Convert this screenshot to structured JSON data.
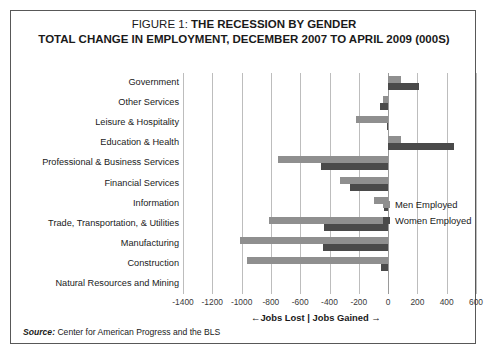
{
  "figure": {
    "title_prefix": "FIGURE 1:",
    "title_main": "THE RECESSION BY GENDER",
    "subtitle": "TOTAL CHANGE IN EMPLOYMENT, DECEMBER 2007 TO APRIL 2009 (000S)",
    "source_label": "Source:",
    "source_text": "Center for American Progress and the BLS",
    "axis_caption": "←Jobs Lost | Jobs Gained →"
  },
  "legend": {
    "position": "inside-right",
    "entries": [
      {
        "name": "Men Employed",
        "color": "#8f8f8f"
      },
      {
        "name": "Women Employed",
        "color": "#4a4a4a"
      }
    ]
  },
  "chart_data": {
    "type": "bar",
    "orientation": "horizontal",
    "title": "FIGURE 1: THE RECESSION BY GENDER",
    "subtitle": "TOTAL CHANGE IN EMPLOYMENT, DECEMBER 2007 TO APRIL 2009 (000S)",
    "xlabel": "←Jobs Lost | Jobs Gained →",
    "ylabel": "",
    "xlim": [
      -1400,
      600
    ],
    "xticks": [
      -1400,
      -1200,
      -1000,
      -800,
      -600,
      -400,
      -200,
      0,
      200,
      400,
      600
    ],
    "xtick_labels": [
      "-1400",
      "-1200",
      "-1000",
      "-800",
      "-600",
      "-400",
      "-200",
      "0",
      "200",
      "400",
      "600"
    ],
    "grid": true,
    "grid_axis": "x",
    "categories": [
      "Government",
      "Other Services",
      "Leisure & Hospitality",
      "Education & Health",
      "Professional & Business Services",
      "Financial Services",
      "Information",
      "Trade, Transportation, & Utilities",
      "Manufacturing",
      "Construction",
      "Natural Resources and Mining"
    ],
    "series": [
      {
        "name": "Men Employed",
        "color": "#8f8f8f",
        "values": [
          90,
          -35,
          -220,
          90,
          -750,
          -330,
          -95,
          -810,
          -1010,
          -960,
          0
        ]
      },
      {
        "name": "Women Employed",
        "color": "#4a4a4a",
        "values": [
          210,
          -55,
          -10,
          450,
          -455,
          -260,
          -30,
          -435,
          -445,
          -50,
          0
        ]
      }
    ]
  }
}
